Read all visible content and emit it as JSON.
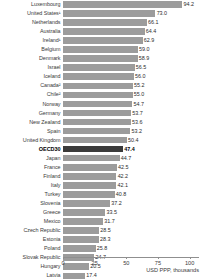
{
  "chart_data": {
    "type": "bar",
    "orientation": "horizontal",
    "title": "",
    "xlabel": "USD PPP, thousands",
    "ylabel": "",
    "xlim": [
      0,
      107
    ],
    "xticks": [
      0,
      25,
      50,
      75,
      100
    ],
    "grid": false,
    "legend": false,
    "highlight_category": "OECD30",
    "categories": [
      "Luxembourg",
      "United States¹",
      "Netherlands",
      "Australia",
      "Ireland¹",
      "Belgium",
      "Denmark",
      "Israel",
      "Iceland",
      "Canada²",
      "Chile²",
      "Norway",
      "Germany",
      "New Zealand",
      "Spain",
      "United Kingdom",
      "OECD30",
      "Japan",
      "France",
      "Finland",
      "Italy",
      "Turkey",
      "Slovenia",
      "Greece",
      "Mexico",
      "Czech Republic",
      "Estonia",
      "Poland",
      "Slovak Republic",
      "Hungary",
      "Latvia"
    ],
    "values": [
      94.2,
      73.0,
      66.1,
      64.4,
      62.9,
      59.0,
      58.9,
      56.5,
      56.0,
      55.2,
      55.0,
      54.7,
      53.7,
      53.6,
      53.2,
      50.4,
      47.4,
      44.7,
      42.5,
      42.2,
      42.1,
      40.8,
      37.2,
      33.5,
      31.7,
      28.5,
      28.3,
      25.8,
      24.7,
      20.5,
      17.4
    ],
    "value_labels": [
      "94.2",
      "73.0",
      "66.1",
      "64.4",
      "62.9",
      "59.0",
      "58.9",
      "56.5",
      "56.0",
      "55.2",
      "55.0",
      "54.7",
      "53.7",
      "53.6",
      "53.2",
      "50.4",
      "47.4",
      "44.7",
      "42.5",
      "42.2",
      "42.1",
      "40.8",
      "37.2",
      "33.5",
      "31.7",
      "28.5",
      "28.3",
      "25.8",
      "24.7",
      "20.5",
      "17.4"
    ],
    "tick_labels": [
      "0",
      "25",
      "50",
      "75",
      "100"
    ],
    "colors": {
      "bar": "#9c9c9c",
      "bar_highlight": "#3b3b3b",
      "axis": "#8f8f8f",
      "text": "#3a3a3a",
      "background": "#ffffff"
    }
  }
}
